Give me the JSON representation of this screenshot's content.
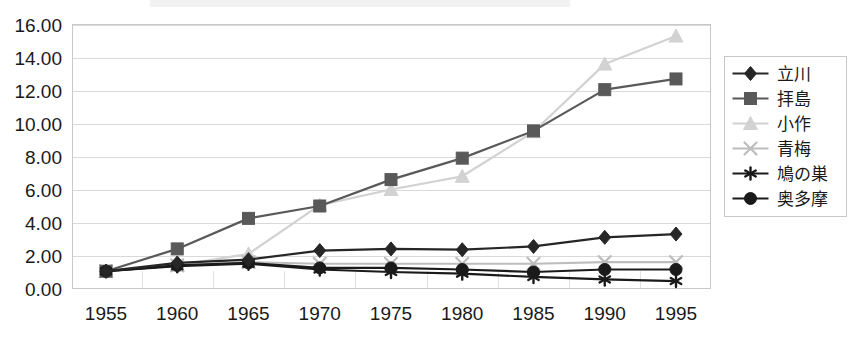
{
  "chart_data": {
    "type": "line",
    "title": "",
    "subtitle": "",
    "xlabel": "",
    "ylabel": "",
    "categories": [
      "1955",
      "1960",
      "1965",
      "1970",
      "1975",
      "1980",
      "1985",
      "1990",
      "1995"
    ],
    "x": [
      1955,
      1960,
      1965,
      1970,
      1975,
      1980,
      1985,
      1990,
      1995
    ],
    "ylim": [
      0,
      16
    ],
    "ytick_step": 2,
    "ytick_labels": [
      "0.00",
      "2.00",
      "4.00",
      "6.00",
      "8.00",
      "10.00",
      "12.00",
      "14.00",
      "16.00"
    ],
    "ytick_values": [
      0,
      2,
      4,
      6,
      8,
      10,
      12,
      14,
      16
    ],
    "grid": true,
    "legend_position": "right",
    "series": [
      {
        "name": "立川",
        "marker": "diamond",
        "color": "#262626",
        "values": [
          1.05,
          1.55,
          1.75,
          2.3,
          2.4,
          2.35,
          2.55,
          3.1,
          3.3
        ]
      },
      {
        "name": "拝島",
        "marker": "square",
        "color": "#595959",
        "values": [
          1.05,
          2.4,
          4.25,
          5.0,
          6.6,
          7.9,
          9.55,
          12.05,
          12.7
        ]
      },
      {
        "name": "小作",
        "marker": "triangle",
        "color": "#d2d2d2",
        "values": [
          1.05,
          1.4,
          2.1,
          5.05,
          6.0,
          6.8,
          9.5,
          13.6,
          15.3
        ]
      },
      {
        "name": "青梅",
        "marker": "x",
        "color": "#bdbdbd",
        "values": [
          1.05,
          1.4,
          1.6,
          1.5,
          1.5,
          1.5,
          1.5,
          1.6,
          1.6
        ]
      },
      {
        "name": "鳩の巣",
        "marker": "asterisk",
        "color": "#1a1a1a",
        "values": [
          1.05,
          1.35,
          1.5,
          1.15,
          1.0,
          0.9,
          0.7,
          0.55,
          0.45
        ]
      },
      {
        "name": "奥多摩",
        "marker": "circle",
        "color": "#1a1a1a",
        "values": [
          1.05,
          1.4,
          1.55,
          1.25,
          1.25,
          1.15,
          1.0,
          1.15,
          1.15
        ]
      }
    ]
  },
  "legend": {
    "items": [
      {
        "label": "立川"
      },
      {
        "label": "拝島"
      },
      {
        "label": "小作"
      },
      {
        "label": "青梅"
      },
      {
        "label": "鳩の巣"
      },
      {
        "label": "奥多摩"
      }
    ]
  }
}
